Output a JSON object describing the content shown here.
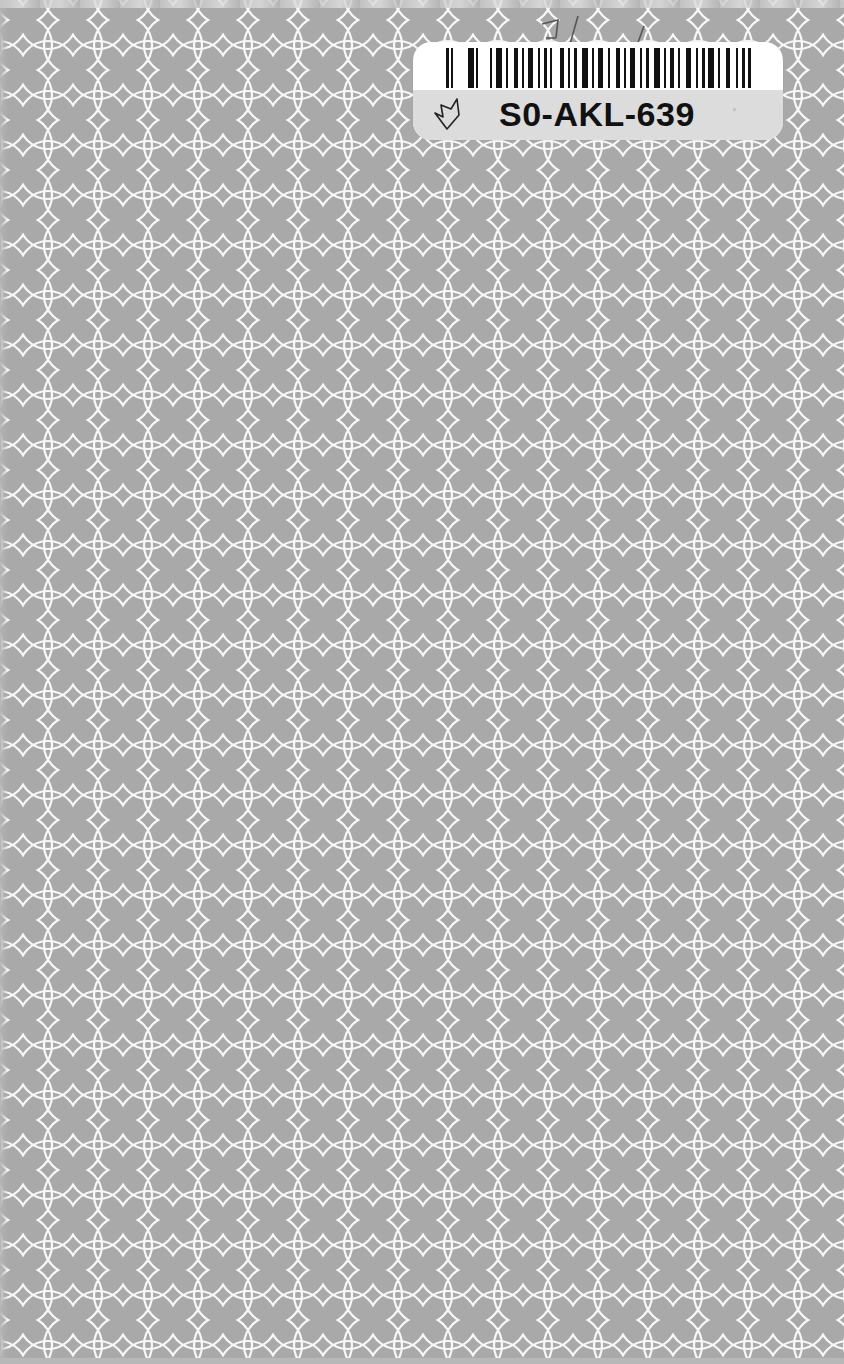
{
  "cover": {
    "background_color": "#a9a9a9",
    "pattern": "interlocking-circles",
    "pattern_color": "#ffffff",
    "pattern_period_px": 50
  },
  "label": {
    "code": "S0-AKL-639",
    "barcode_icon": "barcode-icon",
    "mark_icon": "checkmark-leaf-icon",
    "top_color": "#ffffff",
    "bottom_color": "#dcdcdc"
  },
  "handwriting": {
    "text": "3/ /"
  }
}
